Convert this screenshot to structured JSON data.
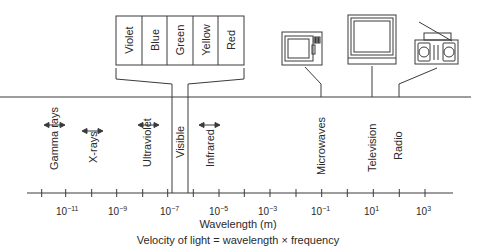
{
  "visible_colors": [
    "Violet",
    "Blue",
    "Green",
    "Yellow",
    "Red"
  ],
  "bands": [
    {
      "label": "Gamma rays"
    },
    {
      "label": "X-rays"
    },
    {
      "label": "Ultraviolet"
    },
    {
      "label": "Visible"
    },
    {
      "label": "Infrared"
    },
    {
      "label": "Microwaves"
    },
    {
      "label": "Television"
    },
    {
      "label": "Radio"
    }
  ],
  "devices": [
    {
      "name": "microwave-oven"
    },
    {
      "name": "television"
    },
    {
      "name": "radio"
    }
  ],
  "axis": {
    "label": "Wavelength (m)",
    "tick_labels": [
      {
        "base": "10",
        "exp": "−11"
      },
      {
        "base": "10",
        "exp": "−9"
      },
      {
        "base": "10",
        "exp": "−7"
      },
      {
        "base": "10",
        "exp": "−5"
      },
      {
        "base": "10",
        "exp": "−3"
      },
      {
        "base": "10",
        "exp": "−1"
      },
      {
        "base": "10",
        "exp": "1"
      },
      {
        "base": "10",
        "exp": "3"
      }
    ]
  },
  "caption": "Velocity of light = wavelength × frequency",
  "colors": {
    "line": "#3a3a3a",
    "text": "#2a2a2a",
    "background": "#ffffff"
  }
}
